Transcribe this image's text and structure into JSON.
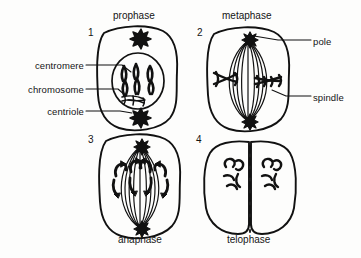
{
  "figure": {
    "kind": "mitosis-diagram",
    "background_color": "#fdfdfc",
    "ink_color": "#111111",
    "panel_count": 4
  },
  "panels": [
    {
      "number": "1",
      "title": "prophase",
      "features": [
        "nucleus",
        "condensed-chromosomes",
        "centrioles"
      ]
    },
    {
      "number": "2",
      "title": "metaphase",
      "features": [
        "spindle",
        "poles",
        "metaphase-plate-chromosomes"
      ]
    },
    {
      "number": "3",
      "title": "anaphase",
      "features": [
        "spindle",
        "poles",
        "separating-chromatids"
      ]
    },
    {
      "number": "4",
      "title": "telophase",
      "features": [
        "two-daughter-cells",
        "cleavage-furrow",
        "decondensing-chromosomes"
      ]
    }
  ],
  "labels": {
    "left": [
      {
        "text": "centromere",
        "target_panel": "1"
      },
      {
        "text": "chromosome",
        "target_panel": "1"
      },
      {
        "text": "centriole",
        "target_panel": "1"
      }
    ],
    "right": [
      {
        "text": "pole",
        "target_panel": "2"
      },
      {
        "text": "spindle",
        "target_panel": "2"
      }
    ]
  }
}
